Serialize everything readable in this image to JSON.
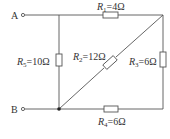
{
  "terminals": {
    "a": "A",
    "b": "B"
  },
  "resistors": [
    {
      "id": "R1",
      "name": "R",
      "sub": "1",
      "value": "=4Ω"
    },
    {
      "id": "R2",
      "name": "R",
      "sub": "2",
      "value": "=12Ω"
    },
    {
      "id": "R3",
      "name": "R",
      "sub": "3",
      "value": "=6Ω"
    },
    {
      "id": "R4",
      "name": "R",
      "sub": "4",
      "value": "=6Ω"
    },
    {
      "id": "R5",
      "name": "R",
      "sub": "5",
      "value": "=10Ω"
    }
  ],
  "colors": {
    "wire": "#555555",
    "text": "#333333"
  }
}
